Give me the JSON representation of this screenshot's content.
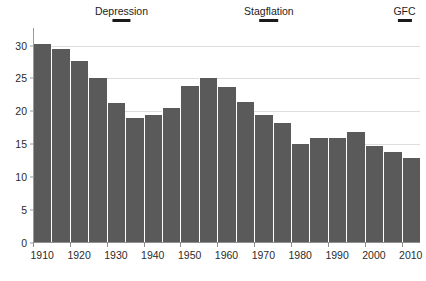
{
  "figure": {
    "clipped_top_text": "",
    "background_color": "#ffffff",
    "bar_color": "#5a5a5a",
    "grid_color": "#dddddd",
    "axis_color": "#8f8f8f"
  },
  "chart_data": {
    "type": "bar",
    "title": "",
    "subtitle": "",
    "xlabel": "",
    "ylabel": "",
    "ylim": [
      0,
      31.6
    ],
    "xlim": [
      1907.5,
      2012.5
    ],
    "grid": true,
    "legend_position": "none",
    "ytick_labels": [
      "0",
      "5",
      "10",
      "15",
      "20",
      "25",
      "30"
    ],
    "yticks": [
      0,
      5,
      10,
      15,
      20,
      25,
      30
    ],
    "xtick_labels": [
      "1910",
      "1920",
      "1930",
      "1940",
      "1950",
      "1960",
      "1970",
      "1980",
      "1990",
      "2000",
      "2010"
    ],
    "xticks": [
      1910,
      1920,
      1930,
      1940,
      1950,
      1960,
      1970,
      1980,
      1990,
      2000,
      2010
    ],
    "categories": [
      1910,
      1915,
      1920,
      1925,
      1930,
      1935,
      1940,
      1945,
      1950,
      1955,
      1960,
      1965,
      1970,
      1975,
      1980,
      1985,
      1990,
      1995,
      2000,
      2005,
      2010
    ],
    "values": [
      30.2,
      29.4,
      27.6,
      25.0,
      21.3,
      19.0,
      19.5,
      20.5,
      23.8,
      25.0,
      23.7,
      21.4,
      19.4,
      18.2,
      15.0,
      16.0,
      16.0,
      16.8,
      14.8,
      13.9,
      12.9
    ],
    "annotations": [
      {
        "label": "Depression",
        "center_year": 1931.5,
        "start_year": 1929,
        "end_year": 1934
      },
      {
        "label": "Stagflation",
        "center_year": 1971.5,
        "start_year": 1969,
        "end_year": 1974
      },
      {
        "label": "GFC",
        "center_year": 2008.3,
        "start_year": 2007,
        "end_year": 2009.5
      }
    ]
  }
}
